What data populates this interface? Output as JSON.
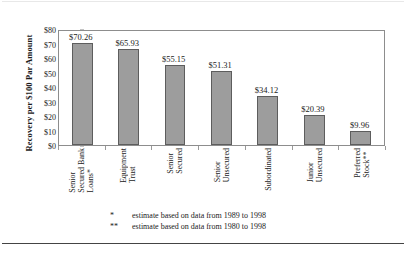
{
  "chart_data": {
    "type": "bar",
    "title": "",
    "xlabel": "",
    "ylabel": "Recovery per $100 Par Amount",
    "ylim": [
      0,
      80
    ],
    "grid": false,
    "legend": "none",
    "categories": [
      "Senior Secured Bank Loans*",
      "Equipment Trust",
      "Senior Secured",
      "Senior Unsecured",
      "Subordinated",
      "Junior Unsecured",
      "Preferred Stock**"
    ],
    "category_lines": [
      [
        "Senior",
        "Secured Bank",
        "Loans*"
      ],
      [
        "Equipment",
        "Trust"
      ],
      [
        "Senior",
        "Secured"
      ],
      [
        "Senior",
        "Unsecured"
      ],
      [
        "Subordinated"
      ],
      [
        "Junior",
        "Unsecured"
      ],
      [
        "Preferred",
        "Stock**"
      ]
    ],
    "values": [
      70.26,
      65.93,
      55.15,
      51.31,
      34.12,
      20.39,
      9.96
    ],
    "value_labels": [
      "$70.26",
      "$65.93",
      "$55.15",
      "$51.31",
      "$34.12",
      "$20.39",
      "$9.96"
    ],
    "ytick_values": [
      0,
      10,
      20,
      30,
      40,
      50,
      60,
      70,
      80
    ],
    "ytick_labels": [
      "$0",
      "$10",
      "$20",
      "$30",
      "$40",
      "$50",
      "$60",
      "$70",
      "$80"
    ],
    "bar_color": "#9d9d9d",
    "bar_edge_color": "#5d5d5d",
    "axis_color": "#8d8d8d"
  },
  "footnotes": [
    {
      "mark": "*",
      "text": "estimate based on data from 1989 to 1998"
    },
    {
      "mark": "**",
      "text": "estimate based on data from 1980 to 1998"
    }
  ]
}
